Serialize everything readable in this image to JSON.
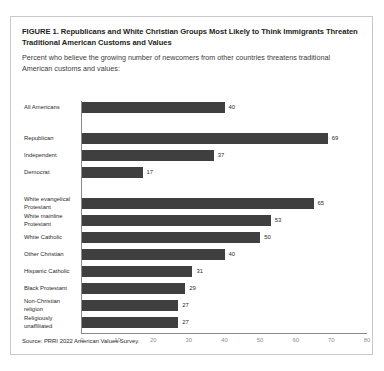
{
  "figure": {
    "title": "FIGURE 1.  Republicans and White Christian Groups Most Likely to Think Immigrants Threaten Traditional American Customs and Values",
    "subtitle": "Percent who believe the growing number of newcomers from other countries threatens traditional American customs and values:",
    "source": "Source: PRRI 2022 American Values Survey."
  },
  "colors": {
    "bar": "#3f3f3f",
    "axis": "#8a8a8a",
    "tick_label": "#8e8e8e",
    "text": "#231f20",
    "panel_border": "#c9c9c9",
    "background": "#ffffff"
  },
  "chart_data": {
    "type": "bar",
    "orientation": "horizontal",
    "title": "FIGURE 1.  Republicans and White Christian Groups Most Likely to Think Immigrants Threaten Traditional American Customs and Values",
    "subtitle": "Percent who believe the growing number of newcomers from other countries threatens traditional American customs and values:",
    "xlabel": "",
    "ylabel": "",
    "xlim": [
      0,
      80
    ],
    "xticks": [
      "0",
      "10",
      "20",
      "30",
      "40",
      "50",
      "60",
      "70",
      "80"
    ],
    "grid": false,
    "legend": false,
    "value_labels": true,
    "categories": [
      "All Americans",
      "Republican",
      "Independent",
      "Democrat",
      "White evangelical Protestant",
      "White mainline Protestant",
      "White Catholic",
      "Other Christian",
      "Hispanic Catholic",
      "Black Protestant",
      "Non-Christian religion",
      "Religiously unaffiliated"
    ],
    "values": [
      40,
      69,
      37,
      17,
      65,
      53,
      50,
      40,
      31,
      29,
      27,
      27
    ],
    "groups": [
      {
        "name": "overall",
        "categories": [
          "All Americans"
        ]
      },
      {
        "name": "party",
        "categories": [
          "Republican",
          "Independent",
          "Democrat"
        ]
      },
      {
        "name": "religion",
        "categories": [
          "White evangelical Protestant",
          "White mainline Protestant",
          "White Catholic",
          "Other Christian",
          "Hispanic Catholic",
          "Black Protestant",
          "Non-Christian religion",
          "Religiously unaffiliated"
        ]
      }
    ],
    "bars": [
      {
        "label": "All Americans",
        "label_lines": [
          "All Americans"
        ],
        "value": 40,
        "value_text": "40"
      },
      {
        "label": "Republican",
        "label_lines": [
          "Republican"
        ],
        "value": 69,
        "value_text": "69"
      },
      {
        "label": "Independent",
        "label_lines": [
          "Independent"
        ],
        "value": 37,
        "value_text": "37"
      },
      {
        "label": "Democrat",
        "label_lines": [
          "Democrat"
        ],
        "value": 17,
        "value_text": "17"
      },
      {
        "label": "White evangelical Protestant",
        "label_lines": [
          "White evangelical",
          "Protestant"
        ],
        "value": 65,
        "value_text": "65"
      },
      {
        "label": "White mainline Protestant",
        "label_lines": [
          "White mainline",
          "Protestant"
        ],
        "value": 53,
        "value_text": "53"
      },
      {
        "label": "White Catholic",
        "label_lines": [
          "White Catholic"
        ],
        "value": 50,
        "value_text": "50"
      },
      {
        "label": "Other Christian",
        "label_lines": [
          "Other Christian"
        ],
        "value": 40,
        "value_text": "40"
      },
      {
        "label": "Hispanic Catholic",
        "label_lines": [
          "Hispanic Catholic"
        ],
        "value": 31,
        "value_text": "31"
      },
      {
        "label": "Black Protestant",
        "label_lines": [
          "Black Protestant"
        ],
        "value": 29,
        "value_text": "29"
      },
      {
        "label": "Non-Christian religion",
        "label_lines": [
          "Non-Christian",
          "religion"
        ],
        "value": 27,
        "value_text": "27"
      },
      {
        "label": "Religiously unaffiliated",
        "label_lines": [
          "Religiously",
          "unaffiliated"
        ],
        "value": 27,
        "value_text": "27"
      }
    ]
  }
}
